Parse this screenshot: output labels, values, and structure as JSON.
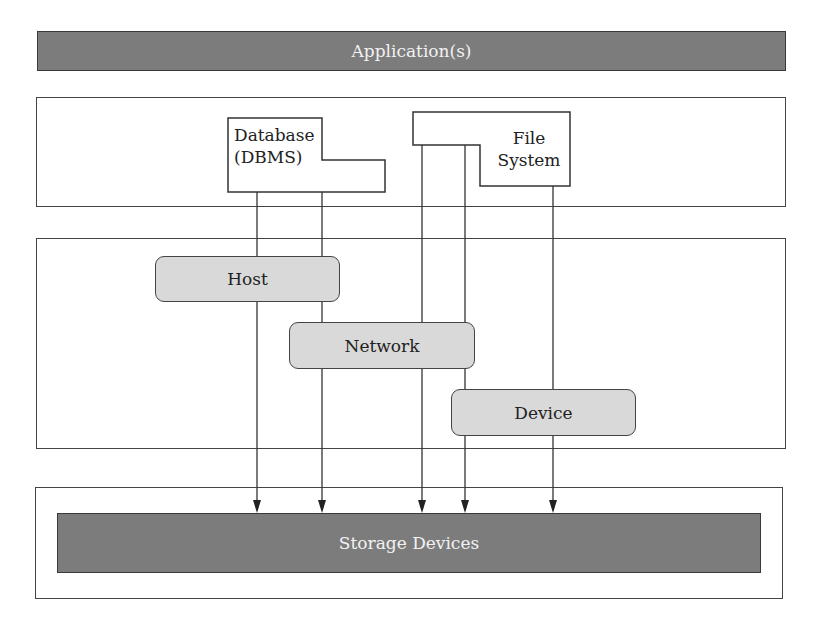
{
  "diagram": {
    "top_bar": {
      "label": "Application(s)",
      "color": "#7c7c7c"
    },
    "upper_layer": {
      "database": {
        "line1": "Database",
        "line2": "(DBMS)"
      },
      "file_system": {
        "line1": "File",
        "line2": "System"
      }
    },
    "middle_layer": {
      "host": {
        "label": "Host",
        "color": "#d9d9d9"
      },
      "network": {
        "label": "Network",
        "color": "#d9d9d9"
      },
      "device": {
        "label": "Device",
        "color": "#d9d9d9"
      }
    },
    "bottom_bar": {
      "label": "Storage Devices",
      "color": "#7c7c7c"
    },
    "arrows": [
      {
        "from": "Database (DBMS)",
        "via": "Host",
        "to": "Storage Devices"
      },
      {
        "from": "Database (DBMS)",
        "via": "Network",
        "to": "Storage Devices"
      },
      {
        "from": "File System",
        "via": "Network",
        "to": "Storage Devices"
      },
      {
        "from": "File System",
        "via": "Device",
        "to": "Storage Devices"
      },
      {
        "from": "File System",
        "via": "Device",
        "to": "Storage Devices"
      }
    ]
  }
}
